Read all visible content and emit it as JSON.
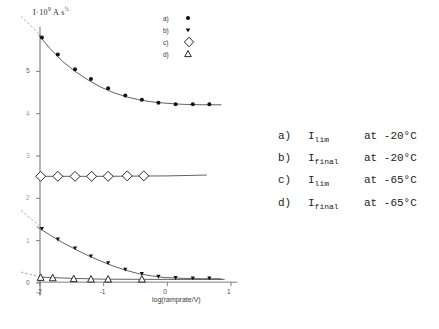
{
  "chart_data": {
    "type": "scatter",
    "title": "",
    "ylabel": "I ·10⁹ A s½",
    "xlabel": "log(ramprate/V)",
    "xlim": [
      -2.25,
      1.15
    ],
    "ylim": [
      -0.35,
      6.15
    ],
    "xticks": [
      -2,
      -1,
      0,
      1
    ],
    "xticklabels": [
      "-2",
      "-1",
      "0",
      "1"
    ],
    "yticks": [
      0,
      1,
      2,
      3,
      4,
      5
    ],
    "yticklabels": [
      "0",
      "1",
      "2",
      "3",
      "4",
      "5"
    ],
    "grid": false,
    "legend_position": "upper-right",
    "series": [
      {
        "name": "a",
        "label": "a)",
        "marker": "filled-circle",
        "color": "#111111",
        "x": [
          -1.97,
          -1.72,
          -1.45,
          -1.2,
          -0.93,
          -0.66,
          -0.4,
          -0.14,
          0.13,
          0.4,
          0.66
        ],
        "y": [
          5.8,
          5.4,
          5.05,
          4.82,
          4.6,
          4.43,
          4.33,
          4.26,
          4.22,
          4.22,
          4.22
        ]
      },
      {
        "name": "b",
        "label": "b)",
        "marker": "filled-triangle-down",
        "color": "#111111",
        "x": [
          -1.97,
          -1.72,
          -1.45,
          -1.2,
          -0.93,
          -0.66,
          -0.4,
          -0.14,
          0.13,
          0.4,
          0.66
        ],
        "y": [
          1.28,
          1.03,
          0.82,
          0.63,
          0.47,
          0.32,
          0.22,
          0.15,
          0.12,
          0.11,
          0.11
        ]
      },
      {
        "name": "c",
        "label": "c)",
        "marker": "open-diamond",
        "color": "#111111",
        "x": [
          -1.99,
          -1.72,
          -1.45,
          -1.19,
          -0.93,
          -0.63,
          -0.37
        ],
        "y": [
          2.52,
          2.52,
          2.52,
          2.52,
          2.52,
          2.53,
          2.53
        ]
      },
      {
        "name": "d",
        "label": "d)",
        "marker": "open-triangle-up",
        "color": "#111111",
        "x": [
          -1.99,
          -1.8,
          -1.47,
          -1.2,
          -0.93,
          -0.4
        ],
        "y": [
          0.13,
          0.12,
          0.1,
          0.09,
          0.09,
          0.09
        ]
      }
    ],
    "fit_curves": [
      {
        "name": "a-fit",
        "points": [
          [
            -2.02,
            5.86
          ],
          [
            -1.85,
            5.55
          ],
          [
            -1.65,
            5.24
          ],
          [
            -1.45,
            5.0
          ],
          [
            -1.25,
            4.8
          ],
          [
            -1.05,
            4.63
          ],
          [
            -0.85,
            4.5
          ],
          [
            -0.65,
            4.4
          ],
          [
            -0.45,
            4.33
          ],
          [
            -0.25,
            4.28
          ],
          [
            -0.05,
            4.25
          ],
          [
            0.25,
            4.22
          ],
          [
            0.55,
            4.21
          ],
          [
            0.85,
            4.21
          ]
        ]
      },
      {
        "name": "b-fit",
        "points": [
          [
            -2.05,
            1.33
          ],
          [
            -1.85,
            1.14
          ],
          [
            -1.65,
            0.96
          ],
          [
            -1.45,
            0.8
          ],
          [
            -1.25,
            0.65
          ],
          [
            -1.05,
            0.52
          ],
          [
            -0.85,
            0.4
          ],
          [
            -0.65,
            0.3
          ],
          [
            -0.45,
            0.22
          ],
          [
            -0.25,
            0.17
          ],
          [
            -0.05,
            0.13
          ],
          [
            0.25,
            0.11
          ],
          [
            0.55,
            0.1
          ],
          [
            0.85,
            0.1
          ]
        ]
      },
      {
        "name": "c-fit",
        "points": [
          [
            -2.02,
            2.52
          ],
          [
            -1.0,
            2.52
          ],
          [
            0.0,
            2.53
          ],
          [
            0.62,
            2.55
          ]
        ]
      },
      {
        "name": "d-fit",
        "points": [
          [
            -2.02,
            0.14
          ],
          [
            -1.5,
            0.11
          ],
          [
            -1.0,
            0.09
          ],
          [
            0.0,
            0.085
          ],
          [
            0.9,
            0.085
          ]
        ]
      }
    ],
    "dashed_extrapolations": [
      {
        "name": "a-dashed",
        "points": [
          [
            -2.3,
            6.3
          ],
          [
            -1.97,
            5.82
          ]
        ]
      },
      {
        "name": "b-dashed",
        "points": [
          [
            -2.3,
            1.72
          ],
          [
            -1.97,
            1.3
          ]
        ]
      },
      {
        "name": "d-dashed",
        "points": [
          [
            -2.3,
            0.26
          ],
          [
            -1.99,
            0.14
          ]
        ]
      }
    ]
  },
  "legend": {
    "items": [
      {
        "key": "a)",
        "marker": "filled-circle"
      },
      {
        "key": "b)",
        "marker": "filled-triangle-down"
      },
      {
        "key": "c)",
        "marker": "open-diamond"
      },
      {
        "key": "d)",
        "marker": "open-triangle-up"
      }
    ]
  },
  "caption": {
    "rows": [
      {
        "key": "a)",
        "symbol": "I",
        "sub": "lim",
        "condition": "at -20°C"
      },
      {
        "key": "b)",
        "symbol": "I",
        "sub": "final",
        "condition": "at -20°C"
      },
      {
        "key": "c)",
        "symbol": "I",
        "sub": "lim",
        "condition": "at -65°C"
      },
      {
        "key": "d)",
        "symbol": "I",
        "sub": "final",
        "condition": "at -65°C"
      }
    ]
  },
  "axis": {
    "y_title_main": "I",
    "y_title_dot": "·10",
    "y_title_exp": "9",
    "y_title_unit": "A s",
    "y_title_unit_exp": "½",
    "x_title": "log(ramprate/V)"
  }
}
